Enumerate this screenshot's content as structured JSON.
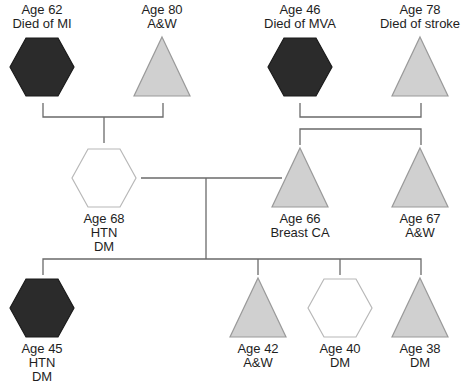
{
  "legend_note": "",
  "colors": {
    "affected_fill": "#2b2b2b",
    "affected_stroke": "#1a1a1a",
    "triangle_fill": "#d0d0d0",
    "triangle_stroke": "#9a9a9a",
    "unaffected_hex_fill": "#ffffff",
    "unaffected_hex_stroke": "#b8b8b8",
    "line": "#6a6a6a"
  },
  "generations": [
    {
      "name": "grandparents",
      "members": [
        {
          "id": "gp1",
          "shape": "hexagon",
          "affected": true,
          "x": 42,
          "y": 67,
          "lines": [
            "Age 62",
            "Died of MI"
          ],
          "label_pos": "above"
        },
        {
          "id": "gp2",
          "shape": "triangle",
          "affected": false,
          "x": 162,
          "y": 67,
          "lines": [
            "Age 80",
            "A&W"
          ],
          "label_pos": "above"
        },
        {
          "id": "gp3",
          "shape": "hexagon",
          "affected": true,
          "x": 300,
          "y": 67,
          "lines": [
            "Age 46",
            "Died of MVA"
          ],
          "label_pos": "above"
        },
        {
          "id": "gp4",
          "shape": "triangle",
          "affected": false,
          "x": 420,
          "y": 67,
          "lines": [
            "Age 78",
            "Died of stroke"
          ],
          "label_pos": "above"
        }
      ]
    },
    {
      "name": "parents",
      "members": [
        {
          "id": "p1",
          "shape": "hexagon",
          "affected": false,
          "x": 104,
          "y": 178,
          "lines": [
            "Age 68",
            "HTN",
            "DM"
          ],
          "label_pos": "below"
        },
        {
          "id": "p2",
          "shape": "triangle",
          "affected": false,
          "x": 300,
          "y": 178,
          "lines": [
            "Age 66",
            "Breast CA"
          ],
          "label_pos": "below"
        },
        {
          "id": "p3",
          "shape": "triangle",
          "affected": false,
          "x": 420,
          "y": 178,
          "lines": [
            "Age 67",
            "A&W"
          ],
          "label_pos": "below"
        }
      ]
    },
    {
      "name": "children",
      "members": [
        {
          "id": "c1",
          "shape": "hexagon",
          "affected": true,
          "x": 42,
          "y": 308,
          "lines": [
            "Age 45",
            "HTN",
            "DM"
          ],
          "label_pos": "below"
        },
        {
          "id": "c2",
          "shape": "triangle",
          "affected": false,
          "x": 258,
          "y": 308,
          "lines": [
            "Age 42",
            "A&W"
          ],
          "label_pos": "below"
        },
        {
          "id": "c3",
          "shape": "hexagon",
          "affected": false,
          "x": 340,
          "y": 308,
          "lines": [
            "Age 40",
            "DM"
          ],
          "label_pos": "below"
        },
        {
          "id": "c4",
          "shape": "triangle",
          "affected": false,
          "x": 420,
          "y": 308,
          "lines": [
            "Age 38",
            "DM"
          ],
          "label_pos": "below"
        }
      ]
    }
  ],
  "relationships": [
    {
      "type": "couple",
      "from": "gp1",
      "to": "gp2"
    },
    {
      "type": "couple",
      "from": "gp3",
      "to": "gp4"
    },
    {
      "type": "descent",
      "parents": [
        "gp1",
        "gp2"
      ],
      "children": [
        "p1"
      ]
    },
    {
      "type": "descent",
      "parents": [
        "gp3",
        "gp4"
      ],
      "children": [
        "p2",
        "p3"
      ]
    },
    {
      "type": "couple",
      "from": "p1",
      "to": "p2"
    },
    {
      "type": "descent",
      "parents": [
        "p1",
        "p2"
      ],
      "children": [
        "c1",
        "c2",
        "c3",
        "c4"
      ]
    }
  ]
}
